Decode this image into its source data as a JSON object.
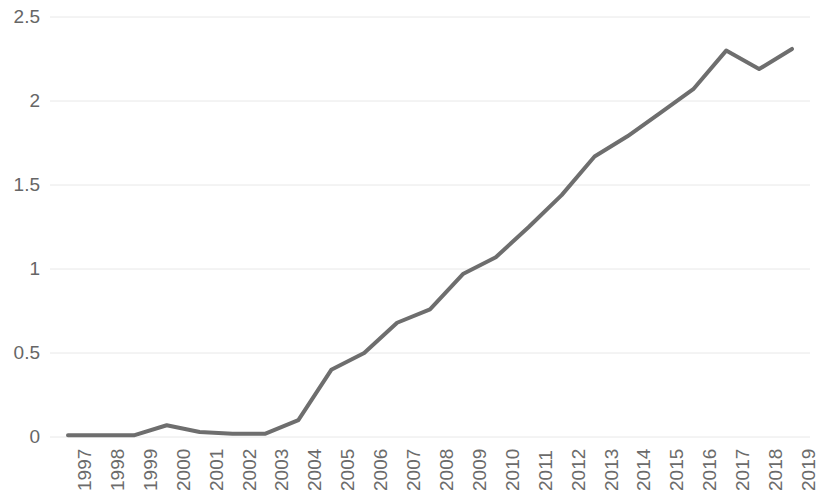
{
  "chart_data": {
    "type": "line",
    "title": "",
    "subtitle": "",
    "xlabel": "",
    "ylabel": "",
    "categories": [
      "1997",
      "1998",
      "1999",
      "2000",
      "2001",
      "2002",
      "2003",
      "2004",
      "2005",
      "2006",
      "2007",
      "2008",
      "2009",
      "2010",
      "2011",
      "2012",
      "2013",
      "2014",
      "2015",
      "2016",
      "2017",
      "2018",
      "2019"
    ],
    "values": [
      0.01,
      0.01,
      0.01,
      0.07,
      0.03,
      0.02,
      0.02,
      0.1,
      0.4,
      0.5,
      0.68,
      0.76,
      0.97,
      1.07,
      1.25,
      1.44,
      1.67,
      1.79,
      1.93,
      2.07,
      2.3,
      2.19,
      2.31
    ],
    "series": [
      {
        "name": "",
        "values": [
          0.01,
          0.01,
          0.01,
          0.07,
          0.03,
          0.02,
          0.02,
          0.1,
          0.4,
          0.5,
          0.68,
          0.76,
          0.97,
          1.07,
          1.25,
          1.44,
          1.67,
          1.79,
          1.93,
          2.07,
          2.3,
          2.19,
          2.31
        ],
        "color": "#6e6e6e"
      }
    ],
    "ylim": [
      0,
      2.5
    ],
    "y_ticks": [
      0,
      0.5,
      1,
      1.5,
      2,
      2.5
    ],
    "y_tick_labels": [
      "0",
      "0.5",
      "1",
      "1.5",
      "2",
      "2.5"
    ],
    "x_tick_labels": [
      "1997",
      "1998",
      "1999",
      "2000",
      "2001",
      "2002",
      "2003",
      "2004",
      "2005",
      "2006",
      "2007",
      "2008",
      "2009",
      "2010",
      "2011",
      "2012",
      "2013",
      "2014",
      "2015",
      "2016",
      "2017",
      "2018",
      "2019"
    ],
    "x_tick_rotation": -90,
    "grid": true,
    "grid_axis": "y",
    "grid_color": "#e8e8e8",
    "legend": false,
    "legend_position": "none",
    "line_color": "#6e6e6e",
    "line_width": 4,
    "markers": false,
    "background_color": "#ffffff",
    "axis_label_color": "#6b6b6b"
  },
  "layout": {
    "plot_left": 68,
    "plot_right": 792,
    "plot_top": 17,
    "plot_bottom": 437
  }
}
